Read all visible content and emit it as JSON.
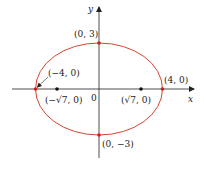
{
  "figure": {
    "type": "ellipse",
    "equation": "x^2/16 + y^2/9 = 1",
    "ellipse_color": "#d9432f",
    "axis_color": "#222222",
    "point_color_vertex": "#c8221a",
    "point_color_focus": "#111111"
  },
  "axes": {
    "x_label": "x",
    "y_label": "y",
    "origin_label": "0"
  },
  "points": {
    "top_vertex": "(0, 3)",
    "bottom_vertex": "(0, −3)",
    "left_vertex": "(−4, 0)",
    "right_vertex": "(4, 0)",
    "left_focus": "(−√7, 0)",
    "right_focus": "(√7, 0)"
  }
}
